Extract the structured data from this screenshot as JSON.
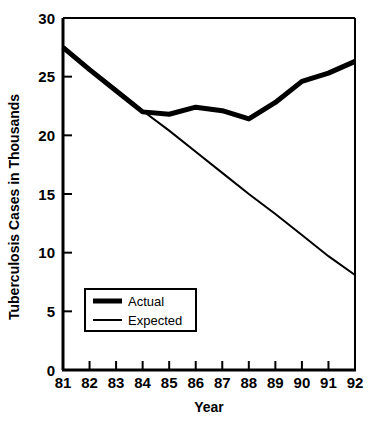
{
  "chart_data": {
    "type": "line",
    "title": "",
    "xlabel": "Year",
    "ylabel": "Tuberculosis Cases in Thousands",
    "x": [
      "81",
      "82",
      "83",
      "84",
      "85",
      "86",
      "87",
      "88",
      "89",
      "90",
      "91",
      "92"
    ],
    "categories": [
      "81",
      "82",
      "83",
      "84",
      "85",
      "86",
      "87",
      "88",
      "89",
      "90",
      "91",
      "92"
    ],
    "xlim": [
      81,
      92
    ],
    "ylim": [
      0,
      30
    ],
    "y_ticks": [
      "0",
      "5",
      "10",
      "15",
      "20",
      "25",
      "30"
    ],
    "y_tick_values": [
      0,
      5,
      10,
      15,
      20,
      25,
      30
    ],
    "grid": false,
    "legend_position": "lower-left",
    "series": [
      {
        "name": "Actual",
        "style": "thick-solid",
        "color": "#000000",
        "values": [
          27.5,
          25.6,
          23.8,
          22.0,
          21.8,
          22.4,
          22.1,
          21.4,
          22.8,
          24.6,
          25.3,
          26.3
        ]
      },
      {
        "name": "Expected",
        "style": "thin-solid",
        "color": "#000000",
        "values": [
          27.5,
          25.7,
          23.9,
          22.1,
          20.4,
          18.6,
          16.8,
          15.0,
          13.3,
          11.5,
          9.7,
          8.1
        ]
      }
    ]
  },
  "axes": {
    "y_title": "Tuberculosis Cases in Thousands",
    "x_title": "Year"
  },
  "legend": {
    "entries": [
      {
        "label": "Actual",
        "style": "thick-solid"
      },
      {
        "label": "Expected",
        "style": "thin-solid"
      }
    ]
  },
  "colors": {
    "ink": "#000000",
    "background": "#ffffff"
  }
}
